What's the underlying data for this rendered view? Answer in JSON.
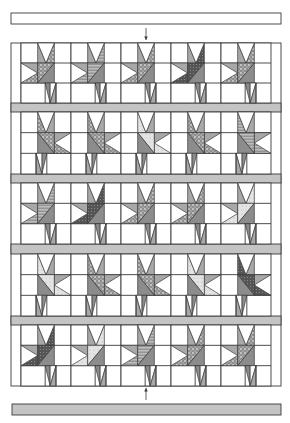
{
  "diagram": {
    "title": "",
    "type": "quilt-assembly-diagram",
    "colors": {
      "background": "#ffffff",
      "line": "#3a3a3a",
      "light_fabric": "#ffffff",
      "medium_fabric": "#a8a8a8",
      "dark_fabric": "#8c8c8c",
      "sashing": "#c4c4c4",
      "pattern_light": "#d6d6d6",
      "pattern_dark": "#555555"
    },
    "top_border": {
      "x": 11,
      "y": 13,
      "w": 270,
      "h": 11,
      "fill": "white"
    },
    "bottom_border": {
      "x": 12,
      "y": 404,
      "w": 269,
      "h": 11,
      "fill": "sashing"
    },
    "arrows": [
      {
        "name": "arrow-down-top",
        "x": 146,
        "y1": 28,
        "y2": 40,
        "direction": "down"
      },
      {
        "name": "arrow-up-bottom",
        "x": 146,
        "y1": 400,
        "y2": 388,
        "direction": "up"
      }
    ],
    "quilt": {
      "x": 11,
      "y": 43,
      "w": 270,
      "h": 343
    },
    "columns": {
      "left_strip": 10,
      "block_w": 50,
      "count": 5
    },
    "rows": [
      {
        "y": 43,
        "h": 60,
        "orientation": "left",
        "fabrics": [
          "dots",
          "hatch",
          "dots",
          "dark",
          "dots"
        ]
      },
      {
        "y": 112,
        "h": 62,
        "orientation": "right",
        "fabrics": [
          "dots",
          "dots",
          "light",
          "dots",
          "hatch"
        ]
      },
      {
        "y": 183,
        "h": 61,
        "orientation": "left",
        "fabrics": [
          "hatch",
          "dark",
          "dots",
          "dots",
          "light"
        ]
      },
      {
        "y": 254,
        "h": 62,
        "orientation": "right",
        "fabrics": [
          "light",
          "dots",
          "dots",
          "light",
          "dark"
        ]
      },
      {
        "y": 325,
        "h": 61,
        "orientation": "left",
        "fabrics": [
          "dark",
          "light",
          "hatch",
          "dots",
          "dots"
        ]
      }
    ],
    "sashing": [
      {
        "y": 103,
        "h": 9
      },
      {
        "y": 174,
        "h": 9
      },
      {
        "y": 244,
        "h": 10
      },
      {
        "y": 316,
        "h": 9
      }
    ]
  }
}
